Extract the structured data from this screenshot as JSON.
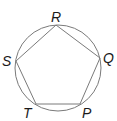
{
  "diagram": {
    "colors": {
      "stroke": "#7a7a7a",
      "label": "#1a1a1a",
      "background": "#ffffff"
    },
    "circle": {
      "cx": 58,
      "cy": 68,
      "r": 43
    },
    "vertices": [
      {
        "name": "R",
        "x": 56,
        "y": 25,
        "label_x": 51,
        "label_y": 22
      },
      {
        "name": "Q",
        "x": 100,
        "y": 58,
        "label_x": 103,
        "label_y": 63
      },
      {
        "name": "P",
        "x": 80,
        "y": 104,
        "label_x": 82,
        "label_y": 118
      },
      {
        "name": "T",
        "x": 36,
        "y": 104,
        "label_x": 23,
        "label_y": 118
      },
      {
        "name": "S",
        "x": 16,
        "y": 61,
        "label_x": 2,
        "label_y": 66
      }
    ],
    "labels": {
      "R": "R",
      "Q": "Q",
      "P": "P",
      "T": "T",
      "S": "S"
    }
  }
}
